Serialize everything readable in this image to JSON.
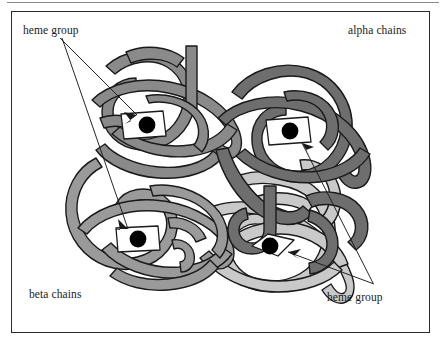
{
  "figure": {
    "title_none": "",
    "frame": {
      "x": 11,
      "y": 11,
      "width": 419,
      "height": 322,
      "border_color": "#2b2b2b"
    },
    "background_color": "#ffffff",
    "top_rule_color": "#8c8c8c"
  },
  "labels": {
    "heme_group_top": "heme group",
    "alpha_chains": "alpha chains",
    "beta_chains": "beta chains",
    "heme_group_bottom": "heme group"
  },
  "colors": {
    "alpha_chain_dark": "#6e6e6e",
    "alpha_chain_light": "#c9c9c9",
    "beta_chain_medium": "#8a8a8a",
    "beta_chain_mid": "#9a9a9a",
    "outline": "#1a1a1a",
    "heme_plate": "#ffffff",
    "heme_iron": "#000000",
    "leader_line": "#1a1a1a"
  },
  "chains": [
    {
      "name": "alpha-chain-upper-right",
      "type": "alpha",
      "fill": "#6e6e6e",
      "position": "upper-right"
    },
    {
      "name": "alpha-chain-lower-right",
      "type": "alpha",
      "fill": "#c9c9c9",
      "position": "lower-right"
    },
    {
      "name": "beta-chain-upper-left",
      "type": "beta",
      "fill": "#8a8a8a",
      "position": "upper-left"
    },
    {
      "name": "beta-chain-lower-left",
      "type": "beta",
      "fill": "#9a9a9a",
      "position": "lower-left"
    }
  ],
  "heme_groups": [
    {
      "name": "heme-upper-left",
      "cx": 143,
      "cy": 125,
      "chain": "beta-chain-upper-left"
    },
    {
      "name": "heme-upper-right",
      "cx": 288,
      "cy": 131,
      "chain": "alpha-chain-upper-right"
    },
    {
      "name": "heme-lower-left",
      "cx": 137,
      "cy": 239,
      "chain": "beta-chain-lower-left"
    },
    {
      "name": "heme-lower-right",
      "cx": 273,
      "cy": 247,
      "chain": "alpha-chain-lower-right"
    }
  ],
  "leader_lines": [
    {
      "name": "leader-heme-top-to-upper-left",
      "from": [
        60,
        38
      ],
      "to": [
        136,
        116
      ]
    },
    {
      "name": "leader-heme-top-to-lower-left",
      "from": [
        62,
        38
      ],
      "to": [
        127,
        228
      ]
    },
    {
      "name": "leader-heme-bottom-to-upper-right",
      "from": [
        373,
        283
      ],
      "to": [
        300,
        143
      ]
    },
    {
      "name": "leader-heme-bottom-to-lower-right",
      "from": [
        374,
        284
      ],
      "to": [
        287,
        252
      ]
    }
  ]
}
